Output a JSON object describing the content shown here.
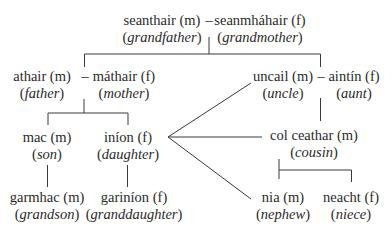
{
  "diagram": {
    "type": "family-tree",
    "language": "Irish",
    "row1": {
      "left": {
        "ga": "seanthair (m)",
        "en": "grandfather"
      },
      "dash": "–",
      "right": {
        "ga": "seanmháhair (f)",
        "en": "grandmother"
      }
    },
    "row2": {
      "left_couple": {
        "left": {
          "ga": "athair (m)",
          "en": "father"
        },
        "dash": "–",
        "right": {
          "ga": "máthair (f)",
          "en": "mother"
        }
      },
      "right_couple": {
        "left": {
          "ga": "uncail (m)",
          "en": "uncle"
        },
        "dash": "–",
        "right": {
          "ga": "aintín (f)",
          "en": "aunt"
        }
      }
    },
    "row3": {
      "son": {
        "ga": "mac (m)",
        "en": "son"
      },
      "daughter": {
        "ga": "iníon (f)",
        "en": "daughter"
      },
      "cousin": {
        "ga": "col ceathar (m)",
        "en": "cousin"
      }
    },
    "row4": {
      "grandson": {
        "ga": "garmhac (m)",
        "en": "grandson"
      },
      "granddaughter": {
        "ga": "gariníon (f)",
        "en": "granddaughter"
      },
      "nephew": {
        "ga": "nia (m)",
        "en": "nephew"
      },
      "niece": {
        "ga": "neacht (f)",
        "en": "niece"
      }
    },
    "paren_open": "(",
    "paren_close": ")"
  }
}
